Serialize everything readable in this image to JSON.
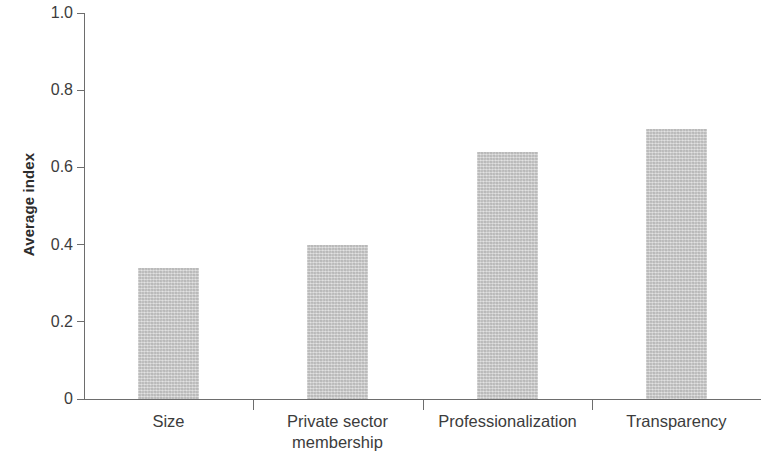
{
  "chart_data": {
    "type": "bar",
    "title": "",
    "subtitle": "",
    "xlabel": "",
    "ylabel": "Average index",
    "categories": [
      "Size",
      "Private sector membership",
      "Professionalization",
      "Transparency"
    ],
    "category_lines": [
      [
        "Size"
      ],
      [
        "Private sector",
        "membership"
      ],
      [
        "Professionalization"
      ],
      [
        "Transparency"
      ]
    ],
    "values": [
      0.34,
      0.4,
      0.64,
      0.7
    ],
    "ylim": [
      0,
      1.0
    ],
    "y_ticks": [
      0,
      0.2,
      0.4,
      0.6,
      0.8,
      1.0
    ],
    "y_tick_labels": [
      "0",
      "0.2",
      "0.4",
      "0.6",
      "0.8",
      "1.0"
    ],
    "grid": false,
    "legend": null,
    "legend_position": "none",
    "bar_color": "#c9c9c9",
    "axis_color": "#6d6d6d",
    "text_color": "#3c3c3c"
  },
  "axis": {
    "y_title": "Average index"
  }
}
